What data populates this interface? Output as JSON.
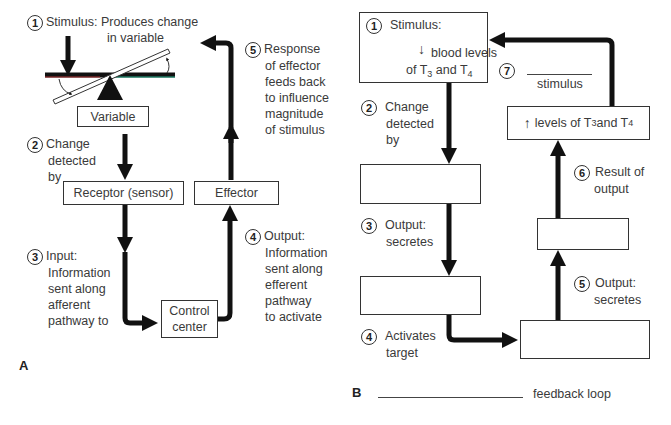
{
  "panel_a": {
    "label": "A",
    "step1": {
      "num": "1",
      "text_line1": "Stimulus: Produces change",
      "text_line2": "in variable"
    },
    "variable_box": "Variable",
    "step2": {
      "num": "2",
      "lines": [
        "Change",
        "detected",
        "by"
      ]
    },
    "receptor_box": "Receptor (sensor)",
    "effector_box": "Effector",
    "step3": {
      "num": "3",
      "lines": [
        "Input:",
        "Information",
        "sent along",
        "afferent",
        "pathway to"
      ]
    },
    "control_center_box": {
      "line1": "Control",
      "line2": "center"
    },
    "step4": {
      "num": "4",
      "lines": [
        "Output:",
        "Information",
        "sent along",
        "efferent",
        "pathway",
        "to activate"
      ]
    },
    "step5": {
      "num": "5",
      "lines": [
        "Response",
        "of effector",
        "feeds back",
        "to influence",
        "magnitude",
        "of stimulus"
      ]
    }
  },
  "panel_b": {
    "label": "B",
    "step1": {
      "num": "1",
      "title": "Stimulus:",
      "line2": "blood levels",
      "line3_pre": "of T",
      "sub_a": "3",
      "line3_mid": " and T",
      "sub_b": "4",
      "arrow": "down-arrow"
    },
    "step2": {
      "num": "2",
      "lines": [
        "Change",
        "detected",
        "by"
      ]
    },
    "step3": {
      "num": "3",
      "lines": [
        "Output:",
        "secretes"
      ]
    },
    "step4": {
      "num": "4",
      "lines": [
        "Activates",
        "target"
      ]
    },
    "step5": {
      "num": "5",
      "lines": [
        "Output:",
        "secretes"
      ]
    },
    "step6": {
      "num": "6",
      "lines": [
        "Result of",
        "output"
      ]
    },
    "step7": {
      "num": "7",
      "blank_label": "stimulus"
    },
    "levels_box": {
      "arrow": "up-arrow",
      "pre": "levels of T",
      "sub_a": "3",
      "mid": " and T",
      "sub_b": "4"
    },
    "blank_boxes": [
      "",
      "",
      "",
      ""
    ],
    "footer": {
      "blank": "",
      "text": "feedback loop"
    }
  }
}
